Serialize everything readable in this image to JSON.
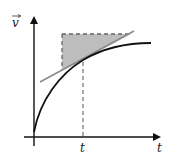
{
  "diagram": {
    "type": "velocity-time graph with tangent",
    "y_axis_label": "v",
    "y_axis_vector_arrow": true,
    "x_axis_label": "t",
    "tick_label": "t",
    "colors": {
      "axis": "#111111",
      "curve": "#111111",
      "tangent": "#8c8c8c",
      "shade": "#bdbdbd",
      "dashed": "#666666"
    },
    "geometry": {
      "origin": [
        34,
        137
      ],
      "y_axis_top": [
        34,
        16
      ],
      "x_axis_right": [
        161,
        137
      ],
      "tangent_point": [
        83,
        59
      ],
      "tangent_line": [
        [
          40,
          82
        ],
        [
          134,
          31
        ]
      ],
      "shaded_triangle": [
        [
          62,
          34
        ],
        [
          130,
          34
        ],
        [
          62,
          70
        ]
      ],
      "dashed_vertical": [
        [
          83,
          60
        ],
        [
          83,
          137
        ]
      ],
      "curve_end": [
        151,
        43
      ]
    }
  }
}
